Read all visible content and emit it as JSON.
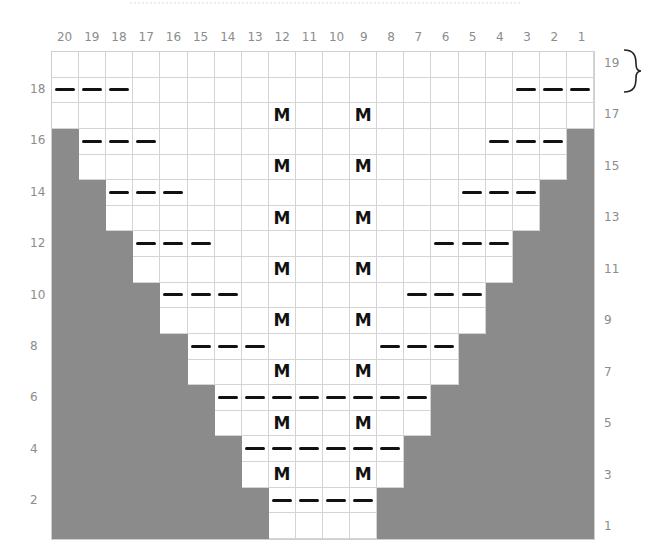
{
  "chart": {
    "columns": [
      20,
      19,
      18,
      17,
      16,
      15,
      14,
      13,
      12,
      11,
      10,
      9,
      8,
      7,
      6,
      5,
      4,
      3,
      2,
      1
    ],
    "rows_top_to_bottom": [
      19,
      18,
      17,
      16,
      15,
      14,
      13,
      12,
      11,
      10,
      9,
      8,
      7,
      6,
      5,
      4,
      3,
      2,
      1
    ],
    "left_row_labels": [
      18,
      16,
      14,
      12,
      10,
      8,
      6,
      4,
      2
    ],
    "right_row_labels": [
      19,
      17,
      15,
      13,
      11,
      9,
      7,
      5,
      3,
      1
    ],
    "colors": {
      "no_stitch": "#8b8b8b",
      "stitch": "#ffffff",
      "symbol": "#111111"
    },
    "legend_symbols": {
      "dash": "purl",
      "M": "make one"
    },
    "row_spec": {
      "19": {
        "gray_left": 0,
        "gray_right": 0,
        "dashes": [],
        "m": []
      },
      "18": {
        "gray_left": 0,
        "gray_right": 0,
        "dashes": [
          20,
          19,
          18,
          3,
          2,
          1
        ],
        "m": []
      },
      "17": {
        "gray_left": 0,
        "gray_right": 0,
        "dashes": [],
        "m": [
          12,
          9
        ]
      },
      "16": {
        "gray_left": 1,
        "gray_right": 1,
        "dashes": [
          19,
          18,
          17,
          4,
          3,
          2
        ],
        "m": []
      },
      "15": {
        "gray_left": 1,
        "gray_right": 1,
        "dashes": [],
        "m": [
          12,
          9
        ]
      },
      "14": {
        "gray_left": 2,
        "gray_right": 2,
        "dashes": [
          18,
          17,
          16,
          5,
          4,
          3
        ],
        "m": []
      },
      "13": {
        "gray_left": 2,
        "gray_right": 2,
        "dashes": [],
        "m": [
          12,
          9
        ]
      },
      "12": {
        "gray_left": 3,
        "gray_right": 3,
        "dashes": [
          17,
          16,
          15,
          6,
          5,
          4
        ],
        "m": []
      },
      "11": {
        "gray_left": 3,
        "gray_right": 3,
        "dashes": [],
        "m": [
          12,
          9
        ]
      },
      "10": {
        "gray_left": 4,
        "gray_right": 4,
        "dashes": [
          16,
          15,
          14,
          7,
          6,
          5
        ],
        "m": []
      },
      "9": {
        "gray_left": 4,
        "gray_right": 4,
        "dashes": [],
        "m": [
          12,
          9
        ]
      },
      "8": {
        "gray_left": 5,
        "gray_right": 5,
        "dashes": [
          15,
          14,
          13,
          8,
          7,
          6
        ],
        "m": []
      },
      "7": {
        "gray_left": 5,
        "gray_right": 5,
        "dashes": [],
        "m": [
          12,
          9
        ]
      },
      "6": {
        "gray_left": 6,
        "gray_right": 6,
        "dashes": [
          14,
          13,
          12,
          11,
          10,
          9,
          8,
          7
        ],
        "m": []
      },
      "5": {
        "gray_left": 6,
        "gray_right": 6,
        "dashes": [],
        "m": [
          12,
          9
        ]
      },
      "4": {
        "gray_left": 7,
        "gray_right": 7,
        "dashes": [
          13,
          12,
          11,
          10,
          9,
          8
        ],
        "m": []
      },
      "3": {
        "gray_left": 7,
        "gray_right": 7,
        "dashes": [],
        "m": [
          12,
          9
        ]
      },
      "2": {
        "gray_left": 8,
        "gray_right": 8,
        "dashes": [
          12,
          11,
          10,
          9
        ],
        "m": []
      },
      "1": {
        "gray_left": 8,
        "gray_right": 8,
        "dashes": [],
        "m": []
      }
    },
    "m_symbol": "M",
    "bracket_rows": [
      19,
      18
    ]
  }
}
